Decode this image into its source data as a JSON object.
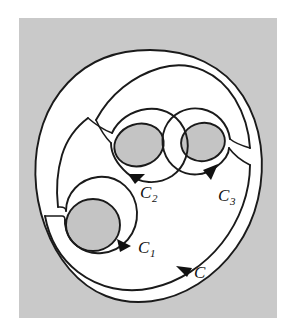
{
  "figure": {
    "caption": "",
    "background_color": "#ffffff",
    "panel_color": "#c9c9c9",
    "region_fill_color": "#ffffff",
    "hole_fill_color": "#c4c4c4",
    "curve_color": "#1a1a1a"
  },
  "labels": {
    "outer_contour": {
      "text": "C",
      "subscript": "",
      "x": 198,
      "y": 272
    },
    "inner_contour_1": {
      "text": "C",
      "subscript": "1",
      "x": 140,
      "y": 252
    },
    "inner_contour_2": {
      "text": "C",
      "subscript": "2",
      "x": 146,
      "y": 195
    },
    "inner_contour_3": {
      "text": "C",
      "subscript": "3",
      "x": 224,
      "y": 198
    }
  },
  "contours": [
    {
      "name": "outer-boundary",
      "label": "C",
      "orientation": "counterclockwise",
      "role": "outer region boundary"
    },
    {
      "name": "inner-hole-1",
      "label": "C1",
      "orientation": "clockwise",
      "role": "hole contour lower left"
    },
    {
      "name": "inner-hole-2",
      "label": "C2",
      "orientation": "clockwise",
      "role": "hole contour upper middle"
    },
    {
      "name": "inner-hole-3",
      "label": "C3",
      "orientation": "clockwise",
      "role": "hole contour upper right"
    }
  ],
  "cross_cuts": [
    {
      "name": "cross-cut-left",
      "connects": [
        "outer-boundary",
        "inner-hole-1"
      ]
    },
    {
      "name": "cross-cut-upper-left",
      "connects": [
        "outer-boundary",
        "inner-hole-2"
      ]
    },
    {
      "name": "cross-cut-right",
      "connects": [
        "outer-boundary",
        "inner-hole-3"
      ]
    }
  ],
  "arrows": [
    {
      "name": "arrow-outer-C",
      "on": "outer-boundary",
      "direction": "left"
    },
    {
      "name": "arrow-inner-C1",
      "on": "inner-hole-1",
      "direction": "up-right"
    },
    {
      "name": "arrow-inner-C2",
      "on": "inner-hole-2",
      "direction": "right"
    },
    {
      "name": "arrow-inner-C3",
      "on": "inner-hole-3",
      "direction": "down-right"
    }
  ]
}
